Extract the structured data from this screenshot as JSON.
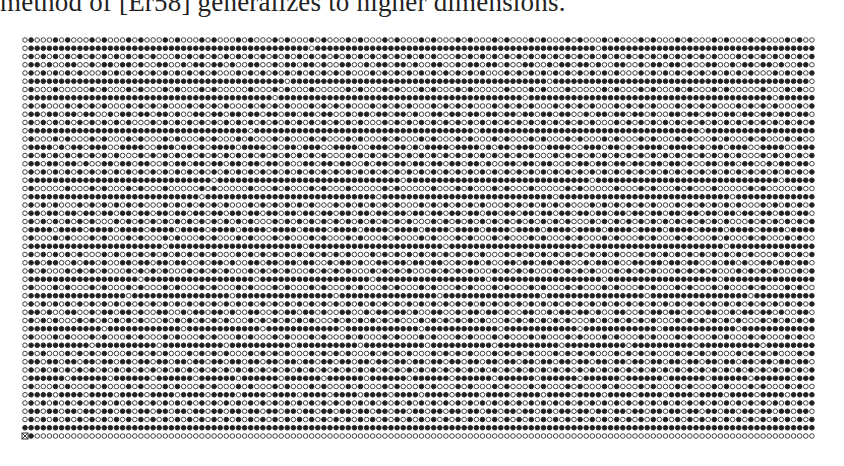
{
  "paper": {
    "text_line": "method of [Er58] generalizes to higher dimensions."
  },
  "figure": {
    "rule": "filled iff gcd(x, y) = 1 (visible lattice points); origin (0,0) marked with boxed cross",
    "columns": 130,
    "rows": 49,
    "x_range": [
      0,
      129
    ],
    "y_range": [
      0,
      48
    ],
    "origin_marker": "boxed-cross",
    "layout": {
      "left": 25,
      "bottom": 436,
      "dx": 6.1,
      "dy": 8.25,
      "radius": 2.3
    },
    "colors": {
      "filled": "#222222",
      "open_stroke": "#444444",
      "background": "#ffffff"
    }
  }
}
